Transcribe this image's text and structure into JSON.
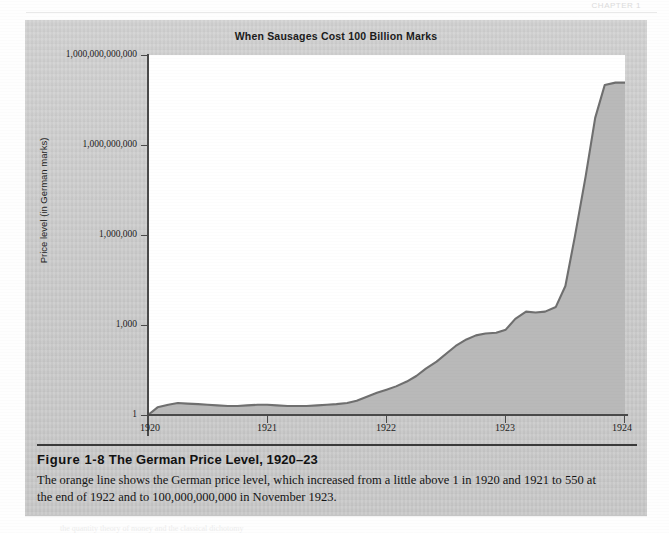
{
  "page": {
    "running_head": "CHAPTER 1",
    "background_color": "#fefefe",
    "show_through_text": "the quantity theory of money and the classical dichotomy"
  },
  "figure": {
    "panel_color": "#cfcfcf",
    "chart_title": "When Sausages Cost 100 Billion Marks",
    "caption_heading_label": "Figure 1-8",
    "caption_heading_title": "The German Price Level, 1920–23",
    "caption_body": "The orange line shows the German price level, which increased from a little above 1 in 1920 and 1921 to 550 at the end of 1922 and to 100,000,000,000 in November 1923."
  },
  "chart_data": {
    "type": "area",
    "title": "When Sausages Cost 100 Billion Marks",
    "xlabel": "",
    "ylabel": "Price level (in German marks)",
    "yscale": "log",
    "ylim": [
      1,
      1000000000000
    ],
    "xlim": [
      1920,
      1924
    ],
    "grid": false,
    "legend": null,
    "plot_background": "#ffffff",
    "line_color": "#6f6f6f",
    "fill_color": "#b9b9b9",
    "y_ticks": [
      {
        "value": 1000000000000,
        "label": "1,000,000,000,000"
      },
      {
        "value": 1000000000,
        "label": "1,000,000,000"
      },
      {
        "value": 1000000,
        "label": "1,000,000"
      },
      {
        "value": 1000,
        "label": "1,000"
      },
      {
        "value": 1,
        "label": "1"
      }
    ],
    "x_ticks": [
      {
        "value": 1920,
        "label": "1920"
      },
      {
        "value": 1921,
        "label": "1921"
      },
      {
        "value": 1922,
        "label": "1922"
      },
      {
        "value": 1923,
        "label": "1923"
      },
      {
        "value": 1924,
        "label": "1924"
      }
    ],
    "series": [
      {
        "name": "German price level",
        "x": [
          1920.0,
          1920.08,
          1920.17,
          1920.25,
          1920.33,
          1920.42,
          1920.5,
          1920.58,
          1920.67,
          1920.75,
          1920.83,
          1920.92,
          1921.0,
          1921.08,
          1921.17,
          1921.25,
          1921.33,
          1921.42,
          1921.5,
          1921.58,
          1921.67,
          1921.75,
          1921.83,
          1921.92,
          1922.0,
          1922.08,
          1922.17,
          1922.25,
          1922.33,
          1922.42,
          1922.5,
          1922.58,
          1922.67,
          1922.75,
          1922.83,
          1922.92,
          1923.0,
          1923.08,
          1923.17,
          1923.25,
          1923.33,
          1923.42,
          1923.5,
          1923.58,
          1923.67,
          1923.75,
          1923.83,
          1923.92,
          1924.0
        ],
        "y": [
          1.0,
          1.8,
          2.2,
          2.5,
          2.4,
          2.3,
          2.2,
          2.1,
          2.0,
          2.0,
          2.1,
          2.2,
          2.2,
          2.1,
          2.0,
          2.0,
          2.0,
          2.1,
          2.2,
          2.3,
          2.5,
          3.0,
          4.0,
          5.5,
          7.0,
          9.0,
          13.0,
          20.0,
          35.0,
          60.0,
          110.0,
          200.0,
          330.0,
          450.0,
          520.0,
          550.0,
          700.0,
          1600.0,
          2800.0,
          2600.0,
          2800.0,
          4000.0,
          20000.0,
          900000.0,
          90000000.0,
          8000000000.0,
          100000000000.0,
          120000000000.0,
          120000000000.0
        ],
        "annotations": [
          {
            "text": "a little above 1 in 1920 and 1921",
            "value": 1.3
          },
          {
            "text": "550 at the end of 1922",
            "value": 550
          },
          {
            "text": "100,000,000,000 in November 1923",
            "value": 100000000000
          }
        ]
      }
    ]
  }
}
